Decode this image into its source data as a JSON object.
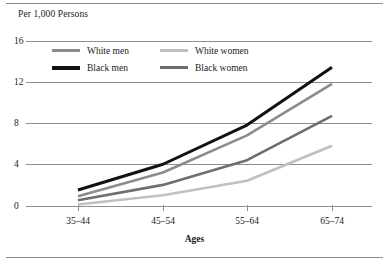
{
  "chart_data": {
    "type": "line",
    "title": "",
    "ylabel": "Per 1,000 Persons",
    "xlabel": "Ages",
    "categories": [
      "35–44",
      "45–54",
      "55–64",
      "65–74"
    ],
    "ylim": [
      0,
      16
    ],
    "yticks": [
      0,
      4,
      8,
      12,
      16
    ],
    "grid": true,
    "legend_position": "top-left-inside",
    "series": [
      {
        "name": "White men",
        "values": [
          0.9,
          3.2,
          6.8,
          11.8
        ],
        "color": "#8c8c8c",
        "width": 2.6
      },
      {
        "name": "White women",
        "values": [
          0.1,
          1.0,
          2.4,
          5.8
        ],
        "color": "#c0c0c0",
        "width": 2.6
      },
      {
        "name": "Black men",
        "values": [
          1.5,
          4.0,
          7.8,
          13.4
        ],
        "color": "#111111",
        "width": 3.0
      },
      {
        "name": "Black women",
        "values": [
          0.5,
          2.0,
          4.4,
          8.7
        ],
        "color": "#6e6e6e",
        "width": 2.6
      }
    ]
  },
  "axis": {
    "y_title": "Per 1,000 Persons",
    "x_title": "Ages",
    "y_labels": [
      "16",
      "12",
      "8",
      "4",
      "0"
    ],
    "x_labels": [
      "35–44",
      "45–54",
      "55–64",
      "65–74"
    ]
  },
  "legend": {
    "items": [
      {
        "label": "White men",
        "color": "#8c8c8c"
      },
      {
        "label": "White women",
        "color": "#c0c0c0"
      },
      {
        "label": "Black men",
        "color": "#111111"
      },
      {
        "label": "Black women",
        "color": "#6e6e6e"
      }
    ]
  },
  "colors": {
    "gridline": "#8f8f8f",
    "rule": "#8a8a8a",
    "text": "#1a1a1a",
    "background": "#ffffff"
  }
}
